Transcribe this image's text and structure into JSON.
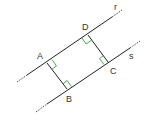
{
  "diagram": {
    "lines": [
      {
        "name": "r",
        "label": "r"
      },
      {
        "name": "s",
        "label": "s"
      }
    ],
    "points": [
      {
        "name": "A",
        "label": "A"
      },
      {
        "name": "B",
        "label": "B"
      },
      {
        "name": "C",
        "label": "C"
      },
      {
        "name": "D",
        "label": "D"
      }
    ],
    "colors": {
      "line": "#222222",
      "right_angle_marker": "#3a9a3a",
      "label": "#333333"
    }
  }
}
